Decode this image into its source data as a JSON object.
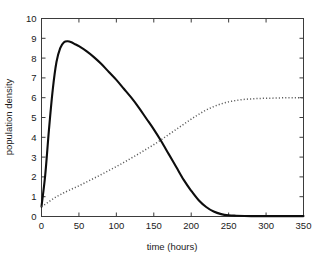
{
  "chart_data": {
    "type": "line",
    "title": "",
    "xlabel": "time (hours)",
    "ylabel": "population density",
    "xlim": [
      0,
      350
    ],
    "ylim": [
      0,
      10
    ],
    "xticks": [
      0,
      50,
      100,
      150,
      200,
      250,
      300,
      350
    ],
    "yticks": [
      0,
      1,
      2,
      3,
      4,
      5,
      6,
      7,
      8,
      9,
      10
    ],
    "grid": false,
    "legend": "none",
    "series": [
      {
        "name": "prey population",
        "style": "solid",
        "color": "#0d0d0d",
        "x": [
          0,
          5,
          10,
          15,
          20,
          25,
          30,
          35,
          40,
          45,
          50,
          60,
          70,
          80,
          90,
          100,
          110,
          120,
          130,
          140,
          150,
          160,
          170,
          180,
          190,
          200,
          210,
          220,
          230,
          240,
          250,
          260,
          280,
          300,
          320,
          350
        ],
        "y": [
          0.5,
          2.1,
          4.4,
          6.4,
          7.8,
          8.5,
          8.8,
          8.85,
          8.8,
          8.7,
          8.6,
          8.35,
          8.05,
          7.7,
          7.3,
          6.9,
          6.45,
          6.0,
          5.5,
          4.95,
          4.4,
          3.8,
          3.15,
          2.5,
          1.85,
          1.3,
          0.82,
          0.48,
          0.25,
          0.12,
          0.06,
          0.04,
          0.02,
          0.02,
          0.02,
          0.02
        ]
      },
      {
        "name": "predator population",
        "style": "dotted",
        "color": "#5a5a5a",
        "x": [
          0,
          5,
          10,
          15,
          20,
          25,
          30,
          40,
          50,
          60,
          70,
          80,
          90,
          100,
          110,
          120,
          130,
          140,
          150,
          160,
          170,
          180,
          190,
          200,
          210,
          220,
          230,
          240,
          250,
          260,
          270,
          280,
          290,
          300,
          310,
          320,
          330,
          340,
          350
        ],
        "y": [
          0.5,
          0.62,
          0.75,
          0.88,
          1.0,
          1.1,
          1.2,
          1.38,
          1.55,
          1.74,
          1.93,
          2.12,
          2.32,
          2.52,
          2.73,
          2.95,
          3.17,
          3.4,
          3.63,
          3.88,
          4.14,
          4.4,
          4.66,
          4.92,
          5.16,
          5.38,
          5.55,
          5.69,
          5.79,
          5.86,
          5.91,
          5.94,
          5.96,
          5.97,
          5.98,
          5.99,
          6.0,
          6.0,
          6.0
        ]
      }
    ],
    "annotations": []
  }
}
